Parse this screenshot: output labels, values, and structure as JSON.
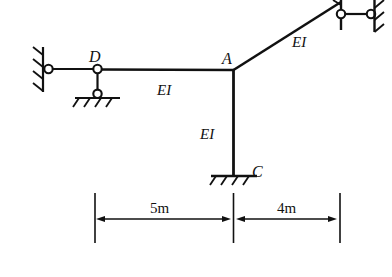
{
  "figure": {
    "type": "structural-frame-diagram",
    "colors": {
      "line": "#111111",
      "background": "#ffffff"
    },
    "nodes": {
      "a_label": "A",
      "c_label": "C",
      "d_label": "D"
    },
    "members": {
      "beam_label": "EI",
      "column_label": "EI",
      "inclined_label": "EI"
    },
    "dimensions": {
      "left_span": "5m",
      "right_span": "4m"
    },
    "supports": {
      "left_wall": "pin-on-wall",
      "d_link": "vertical-link-to-pinned-ground",
      "c_base": "fixed-support",
      "top_right": "horizontal-link-to-pinned-wall"
    }
  }
}
